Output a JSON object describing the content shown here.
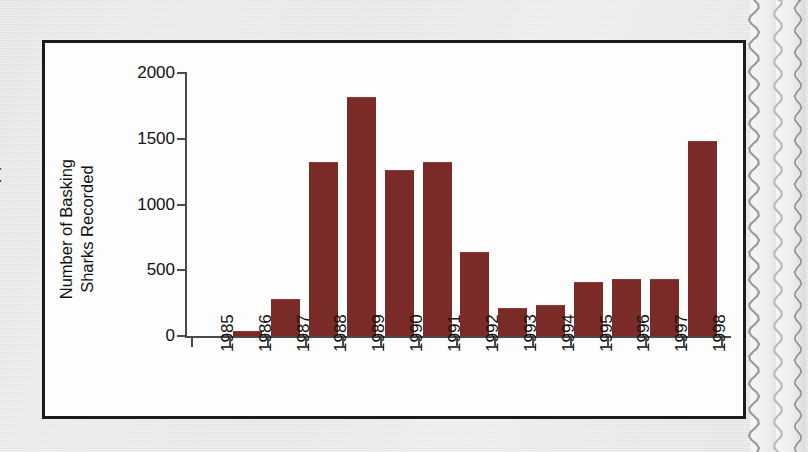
{
  "page": {
    "background_color": "#e9eaea",
    "left_cut_glyph": "t",
    "edge_description": "torn-paper-edge"
  },
  "chart_frame": {
    "border_color": "#1b1b1b",
    "plot_background": "#fdfdfd"
  },
  "chart_data": {
    "type": "bar",
    "title": "",
    "xlabel": "",
    "ylabel": "Number of Basking Sharks Recorded",
    "ylabel_line1": "Number of Basking",
    "ylabel_line2": "Sharks Recorded",
    "categories": [
      "1985",
      "1986",
      "1987",
      "1988",
      "1989",
      "1990",
      "1991",
      "1992",
      "1993",
      "1994",
      "1995",
      "1996",
      "1997",
      "1998"
    ],
    "values": [
      0,
      40,
      280,
      1320,
      1815,
      1260,
      1320,
      640,
      215,
      235,
      410,
      435,
      435,
      1480
    ],
    "ylim": [
      0,
      2000
    ],
    "yticks": [
      0,
      500,
      1000,
      1500,
      2000
    ],
    "ytick_labels": [
      "0",
      "500",
      "1000",
      "1500",
      "2000"
    ],
    "grid": false,
    "legend": null,
    "bar_color": "#7a2b28",
    "axis_color": "#4a4a4a",
    "tick_direction": "outward",
    "xtick_label_rotation": -90
  }
}
